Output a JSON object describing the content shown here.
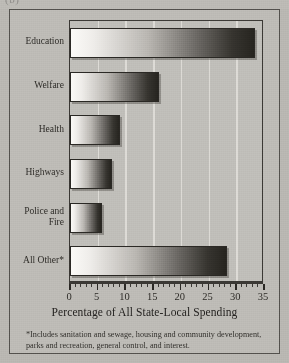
{
  "page": {
    "background_color": "#b9b7b2",
    "frame_color": "#54524e",
    "top_clipped_text": "(b)"
  },
  "chart_data": {
    "type": "bar",
    "orientation": "horizontal",
    "title": "",
    "subtitle": "",
    "xlabel": "Percentage of All State-Local Spending",
    "ylabel": "",
    "categories": [
      "Education",
      "Welfare",
      "Health",
      "Highways",
      "Police and Fire",
      "All Other*"
    ],
    "values": [
      33.4,
      16.1,
      9.0,
      7.6,
      5.8,
      28.3
    ],
    "xlim": [
      0,
      35
    ],
    "xticks": [
      0,
      5,
      10,
      15,
      20,
      25,
      30,
      35
    ],
    "xtick_labels": [
      "0",
      "5",
      "10",
      "15",
      "20",
      "25",
      "30",
      "35"
    ],
    "minor_tick_step": 1,
    "grid": "vertical-only",
    "gridline_color": "#e2e0da",
    "legend": "none",
    "bar_fill": "gradient-white-to-black",
    "bar_edge_color": "#2a2824",
    "plot_background": "#c0beb9"
  },
  "axis": {
    "title": "Percentage of All State-Local Spending",
    "tick_labels": [
      "0",
      "5",
      "10",
      "15",
      "20",
      "25",
      "30",
      "35"
    ]
  },
  "category_labels": [
    {
      "text": "Education",
      "lines": [
        "Education"
      ]
    },
    {
      "text": "Welfare",
      "lines": [
        "Welfare"
      ]
    },
    {
      "text": "Health",
      "lines": [
        "Health"
      ]
    },
    {
      "text": "Highways",
      "lines": [
        "Highways"
      ]
    },
    {
      "text": "Police and Fire",
      "lines": [
        "Police and",
        "Fire"
      ]
    },
    {
      "text": "All Other*",
      "lines": [
        "All Other*"
      ]
    }
  ],
  "footnote": {
    "text": "*Includes sanitation and sewage, housing and community development, parks and recreation, general control, and interest."
  }
}
